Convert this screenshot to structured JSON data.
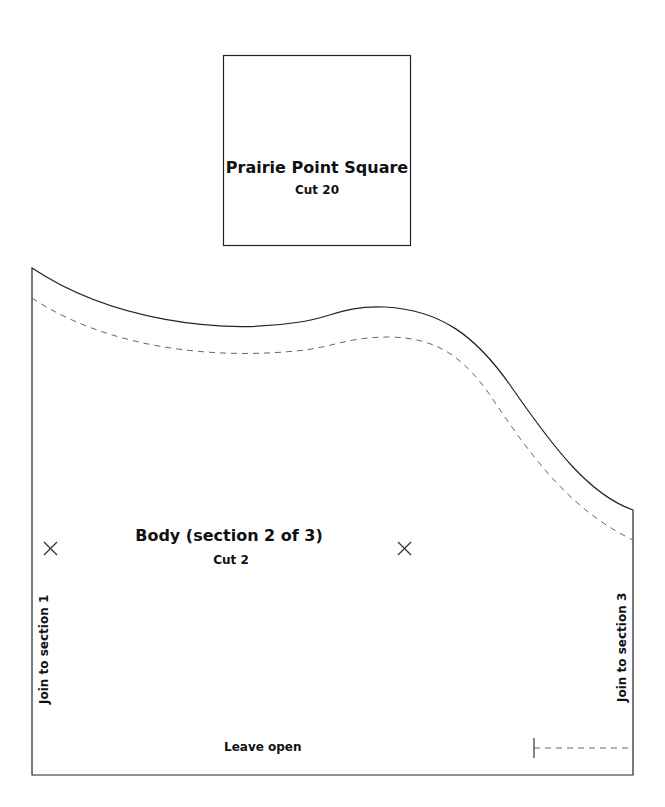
{
  "pieces": {
    "square": {
      "title": "Prairie Point Square",
      "cut": "Cut 20"
    },
    "body": {
      "title": "Body (section 2 of 3)",
      "cut": "Cut 2",
      "left_edge_label": "Join to section 1",
      "right_edge_label": "Join to section 3",
      "bottom_edge_label": "Leave open"
    }
  },
  "colors": {
    "outline": "#222222",
    "seam": "#666666",
    "background": "#ffffff"
  }
}
